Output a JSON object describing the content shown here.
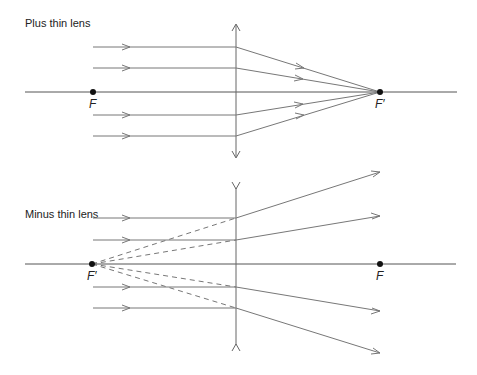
{
  "diagrams": [
    {
      "title": "Plus thin lens",
      "focal_point_front_label": "F",
      "focal_point_back_label": "F′",
      "lens_type": "converging",
      "ray_count": 4
    },
    {
      "title": "Minus thin lens",
      "focal_point_front_label": "F′",
      "focal_point_back_label": "F",
      "lens_type": "diverging",
      "ray_count": 4,
      "virtual_rays": "dashed"
    }
  ],
  "colors": {
    "line": "#555555",
    "ray": "#777777",
    "point": "#111111"
  }
}
